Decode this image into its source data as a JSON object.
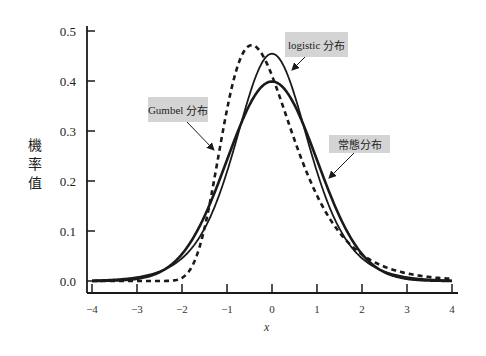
{
  "chart_data": {
    "type": "line",
    "title": "",
    "xlabel": "x",
    "ylabel": "機率值",
    "xlim": [
      -4,
      4
    ],
    "ylim": [
      0,
      0.5
    ],
    "grid": false,
    "legend": "annotations with arrows",
    "x_ticks": [
      "−4",
      "−3",
      "−2",
      "−1",
      "0",
      "1",
      "2",
      "3",
      "4"
    ],
    "y_ticks": [
      "0.0",
      "0.1",
      "0.2",
      "0.3",
      "0.4",
      "0.5"
    ],
    "x": [
      -4,
      -3.5,
      -3,
      -2.5,
      -2,
      -1.5,
      -1,
      -0.5,
      0,
      0.5,
      1,
      1.5,
      2,
      2.5,
      3,
      3.5,
      4
    ],
    "series": [
      {
        "name": "常態分布",
        "style": "solid-thick",
        "params": {
          "mean": 0,
          "sd": 1
        },
        "values": [
          0.0001,
          0.0009,
          0.0044,
          0.0175,
          0.054,
          0.1295,
          0.242,
          0.3521,
          0.3989,
          0.3521,
          0.242,
          0.1295,
          0.054,
          0.0175,
          0.0044,
          0.0009,
          0.0001
        ]
      },
      {
        "name": "logistic 分布",
        "style": "solid",
        "params": {
          "location": 0,
          "scale": 0.55
        },
        "values": [
          0.0012,
          0.0031,
          0.0078,
          0.0192,
          0.0454,
          0.0981,
          0.1796,
          0.2948,
          0.4545,
          0.2948,
          0.1796,
          0.0981,
          0.0454,
          0.0192,
          0.0078,
          0.0031,
          0.0012
        ]
      },
      {
        "name": "Gumbel 分布",
        "style": "dashed",
        "params": {
          "location": -0.45,
          "scale": 0.78
        },
        "values": [
          0.0,
          0.0,
          0.0,
          0.0,
          0.0009,
          0.0569,
          0.2869,
          0.47,
          0.4127,
          0.2939,
          0.1877,
          0.1118,
          0.0638,
          0.0355,
          0.0195,
          0.0106,
          0.0057
        ]
      }
    ],
    "annotations": [
      {
        "text_latin": "Gumbel",
        "text_cjk": "分布",
        "target_series": "Gumbel 分布"
      },
      {
        "text_latin": "logistic",
        "text_cjk": "分布",
        "target_series": "logistic 分布"
      },
      {
        "text_latin": "",
        "text_cjk": "常態分布",
        "target_series": "常態分布"
      }
    ]
  },
  "colors": {
    "line": "#1a1a1a",
    "annotation_bg": "#d4d4d4",
    "axis": "#1a1a1a"
  }
}
